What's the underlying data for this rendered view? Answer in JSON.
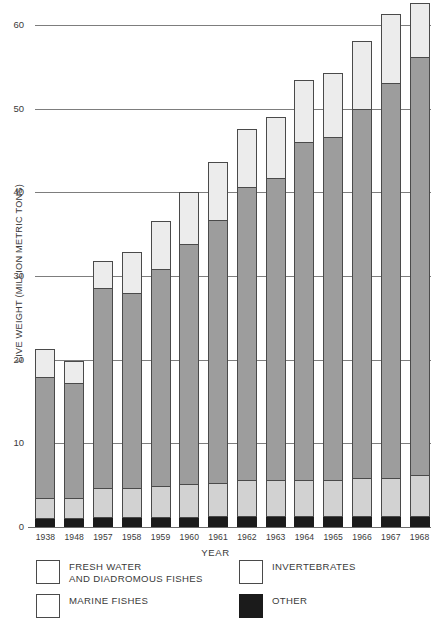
{
  "chart_data": {
    "type": "bar",
    "stacked": true,
    "title": "",
    "xlabel": "YEAR",
    "ylabel": "LIVE WEIGHT (MILLION METRIC TONS)",
    "categories": [
      "1938",
      "1948",
      "1957",
      "1958",
      "1959",
      "1960",
      "1961",
      "1962",
      "1963",
      "1964",
      "1965",
      "1966",
      "1967",
      "1968"
    ],
    "ylim": [
      0,
      62.5
    ],
    "yticks": [
      0,
      10,
      20,
      30,
      40,
      50,
      60
    ],
    "ytick_labels": [
      "0",
      "10",
      "20",
      "30",
      "40",
      "50",
      "60"
    ],
    "grid": "horizontal",
    "legend_position": "below",
    "series": [
      {
        "name": "OTHER",
        "color": "#1b1b1b",
        "values": [
          1.0,
          0.9,
          1.1,
          1.1,
          1.1,
          1.1,
          1.2,
          1.2,
          1.2,
          1.2,
          1.2,
          1.2,
          1.2,
          1.2
        ]
      },
      {
        "name": "FRESH WATER AND DIADROMOUS FISHES",
        "color": "#d2d2d2",
        "values": [
          2.4,
          2.5,
          3.4,
          3.4,
          3.7,
          3.9,
          4.0,
          4.3,
          4.3,
          4.3,
          4.3,
          4.5,
          4.5,
          4.9
        ]
      },
      {
        "name": "MARINE FISHES",
        "color": "#9d9d9d",
        "values": [
          14.4,
          13.7,
          24.0,
          23.4,
          25.9,
          28.7,
          31.4,
          35.0,
          36.1,
          40.4,
          41.0,
          44.1,
          47.3,
          50.0
        ]
      },
      {
        "name": "INVERTEBRATES",
        "color": "#ececec",
        "values": [
          3.3,
          2.6,
          3.2,
          4.9,
          5.8,
          6.2,
          6.9,
          7.0,
          7.3,
          7.4,
          7.6,
          8.2,
          8.2,
          6.4
        ]
      }
    ],
    "totals": [
      21.1,
      19.7,
      31.7,
      32.8,
      36.5,
      39.9,
      43.5,
      47.5,
      48.9,
      53.3,
      54.1,
      58.0,
      61.2,
      62.5
    ]
  },
  "legend": {
    "entries": [
      {
        "label": "FRESH WATER\nAND DIADROMOUS FISHES",
        "swatch": "light",
        "column": "left"
      },
      {
        "label": "MARINE FISHES",
        "swatch": "light",
        "column": "left"
      },
      {
        "label": "INVERTEBRATES",
        "swatch": "light",
        "column": "right"
      },
      {
        "label": "OTHER",
        "swatch": "dark",
        "column": "right"
      }
    ]
  }
}
